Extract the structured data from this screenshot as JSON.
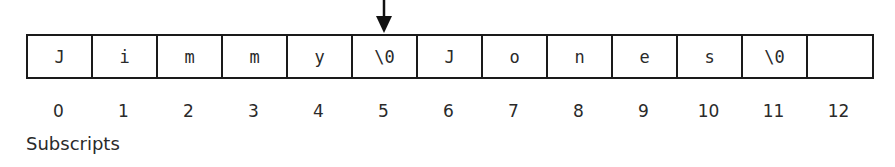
{
  "diagram": {
    "pointer_index": 5,
    "cells": [
      "J",
      "i",
      "m",
      "m",
      "y",
      "\\0",
      "J",
      "o",
      "n",
      "e",
      "s",
      "\\0",
      ""
    ],
    "indices": [
      "0",
      "1",
      "2",
      "3",
      "4",
      "5",
      "6",
      "7",
      "8",
      "9",
      "10",
      "11",
      "12"
    ],
    "label": "Subscripts"
  }
}
